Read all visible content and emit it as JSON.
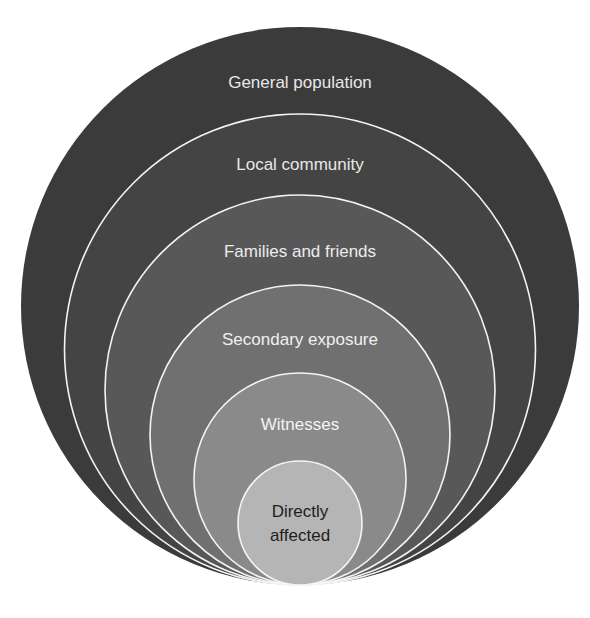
{
  "diagram": {
    "title": "",
    "type": "nested-circles",
    "stroke_color": "#f4f4f4",
    "rings": [
      {
        "label_lines": [
          "General population"
        ],
        "fill": "#3b3b3b",
        "label_color": "#e8e8e8",
        "cx": 300,
        "cy": 306,
        "r": 279,
        "label_y": 82
      },
      {
        "label_lines": [
          "Local community"
        ],
        "fill": "#444444",
        "label_color": "#e8e8e8",
        "cx": 300,
        "cy": 349.5,
        "r": 235.5,
        "label_y": 164
      },
      {
        "label_lines": [
          "Families and friends"
        ],
        "fill": "#585858",
        "label_color": "#ececec",
        "cx": 300,
        "cy": 390,
        "r": 195,
        "label_y": 251
      },
      {
        "label_lines": [
          "Secondary exposure"
        ],
        "fill": "#707070",
        "label_color": "#f0f0f0",
        "cx": 300,
        "cy": 435,
        "r": 150,
        "label_y": 339
      },
      {
        "label_lines": [
          "Witnesses"
        ],
        "fill": "#8a8a8a",
        "label_color": "#f4f4f4",
        "cx": 300,
        "cy": 479,
        "r": 106,
        "label_y": 424
      },
      {
        "label_lines": [
          "Directly",
          "affected"
        ],
        "fill": "#b5b5b5",
        "label_color": "#1e1e1e",
        "cx": 300,
        "cy": 523,
        "r": 62,
        "label_y": 523
      }
    ]
  }
}
